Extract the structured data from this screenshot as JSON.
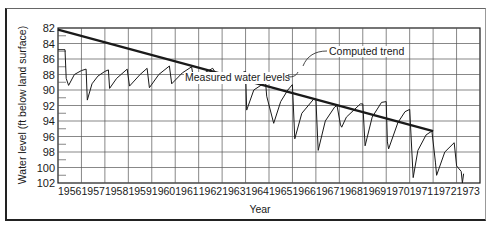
{
  "chart_data": {
    "type": "line",
    "title": "",
    "xlabel": "Year",
    "ylabel": "Water level (ft below land surface)",
    "x_ticks": [
      "1956",
      "1957",
      "1958",
      "1959",
      "1960",
      "1961",
      "1962",
      "1963",
      "1964",
      "1965",
      "1966",
      "1967",
      "1968",
      "1969",
      "1970",
      "1971",
      "1972",
      "1973"
    ],
    "y_ticks": [
      82,
      84,
      86,
      88,
      90,
      92,
      94,
      96,
      98,
      100,
      102
    ],
    "ylim": [
      102,
      82
    ],
    "y_inverted": true,
    "xlim": [
      1956,
      1974
    ],
    "grid": true,
    "annotations": [
      {
        "text": "Computed trend",
        "points_to": "trend line near 1965.3"
      },
      {
        "text": "Measured water levels",
        "points_to": "measured series near 1964.3"
      }
    ],
    "series": [
      {
        "name": "Computed trend",
        "style": "thick straight line",
        "x": [
          1956.0,
          1972.0
        ],
        "y": [
          82.2,
          95.3
        ]
      },
      {
        "name": "Measured water levels",
        "style": "thin line",
        "x": [
          1956.0,
          1956.3,
          1956.35,
          1956.45,
          1956.7,
          1957.0,
          1957.2,
          1957.25,
          1957.45,
          1957.7,
          1958.0,
          1958.15,
          1958.2,
          1958.5,
          1958.95,
          1959.05,
          1959.5,
          1959.8,
          1959.9,
          1960.3,
          1960.75,
          1960.85,
          1961.3,
          1961.7,
          1961.8,
          1962.3,
          1962.6,
          1962.8,
          1963.1,
          1963.35,
          1963.45,
          1963.7,
          1963.9,
          1964.0,
          1964.05,
          1964.35,
          1964.7,
          1964.85,
          1964.9,
          1965.2,
          1965.5,
          1965.8,
          1966.0,
          1966.1,
          1966.4,
          1966.9,
          1967.0,
          1967.1,
          1967.4,
          1967.8,
          1967.9,
          1968.05,
          1968.1,
          1968.3,
          1968.9,
          1969.0,
          1969.1,
          1969.4,
          1969.8,
          1970.0,
          1970.05,
          1970.1,
          1970.5,
          1970.8,
          1971.0,
          1971.15,
          1971.35,
          1971.7,
          1971.95,
          1972.1,
          1972.15,
          1972.5,
          1972.9,
          1973.0,
          1973.2,
          1973.25,
          1973.3
        ],
        "y": [
          84.8,
          84.8,
          88.5,
          89.4,
          88.0,
          87.5,
          87.3,
          91.3,
          89.2,
          88.2,
          87.6,
          87.4,
          89.8,
          88.5,
          87.3,
          89.5,
          88.0,
          87.2,
          89.7,
          88.0,
          86.9,
          89.2,
          87.8,
          87.0,
          88.9,
          87.7,
          87.2,
          88.2,
          88.0,
          87.8,
          89.0,
          88.2,
          87.7,
          87.6,
          92.6,
          90.0,
          89.3,
          88.9,
          90.8,
          94.3,
          91.5,
          90.0,
          89.3,
          96.3,
          93.0,
          91.2,
          91.2,
          97.8,
          94.0,
          92.2,
          92.0,
          94.5,
          94.8,
          93.5,
          91.8,
          91.8,
          97.2,
          93.5,
          91.6,
          91.5,
          96.7,
          97.6,
          94.2,
          92.8,
          92.5,
          101.3,
          97.8,
          95.8,
          95.3,
          99.4,
          101.0,
          98.0,
          96.8,
          99.8,
          100.5,
          102.0,
          100.8
        ]
      }
    ],
    "plot_area_px": {
      "left": 58,
      "top": 28,
      "right": 480,
      "bottom": 183
    },
    "colors": {
      "line": "#1a1a1a",
      "grid": "#555555",
      "background": "#ffffff"
    }
  }
}
